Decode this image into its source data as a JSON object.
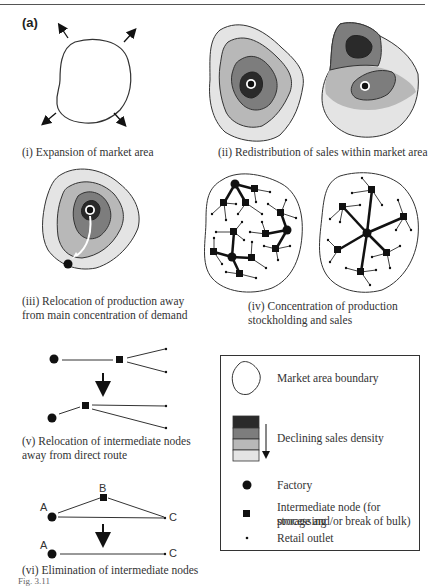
{
  "figure": {
    "panel_label": "(a)",
    "figure_number": "Fig. 3.11",
    "colors": {
      "darkest": "#2a2a2a",
      "dark": "#7d7d7d",
      "medium": "#b8b8b8",
      "light": "#e4e4e4",
      "outline": "#333333"
    }
  },
  "panels": [
    {
      "id": "i",
      "caption": "(i) Expansion of market area"
    },
    {
      "id": "ii",
      "caption": "(ii) Redistribution of sales within market area"
    },
    {
      "id": "iii",
      "caption_line1": "(iii) Relocation of production away",
      "caption_line2": "from main concentration of demand"
    },
    {
      "id": "iv",
      "caption_line1": "(iv) Concentration of production",
      "caption_line2": "stockholding and sales"
    },
    {
      "id": "v",
      "caption_line1": "(v) Relocation of intermediate nodes",
      "caption_line2": "away from direct route"
    },
    {
      "id": "vi",
      "caption": "(vi) Elimination of intermediate nodes",
      "node_labels": {
        "a_top": "A",
        "b": "B",
        "c_top": "C",
        "a_bottom": "A",
        "c_bottom": "C"
      }
    }
  ],
  "legend": {
    "items": [
      {
        "symbol": "boundary-outline",
        "label": "Market area boundary"
      },
      {
        "symbol": "density-scale",
        "label": "Declining sales density"
      },
      {
        "symbol": "filled-circle",
        "label": "Factory"
      },
      {
        "symbol": "filled-square",
        "label_line1": "Intermediate node (for processing",
        "label_line2": "storage and/or break of bulk)"
      },
      {
        "symbol": "small-dot",
        "label": "Retail outlet"
      }
    ]
  }
}
